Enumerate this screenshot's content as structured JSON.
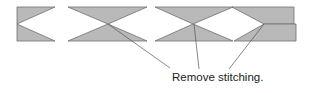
{
  "diagram": {
    "callout_label": "Remove stitching.",
    "colors": {
      "fill": "#b9b9b9",
      "stroke": "#6e6e6e",
      "leader": "#555555",
      "text": "#222222"
    },
    "shapes": [
      {
        "name": "end-piece-left",
        "description": "rectangle with V notch on left edge"
      },
      {
        "name": "bowtie-1",
        "description": "two triangles meeting at a point (stitch)"
      },
      {
        "name": "bowtie-2",
        "description": "two triangles meeting at a point (stitch)"
      },
      {
        "name": "end-piece-right",
        "description": "two offset rectangles with diamond notch on left"
      }
    ],
    "callouts": 3
  }
}
